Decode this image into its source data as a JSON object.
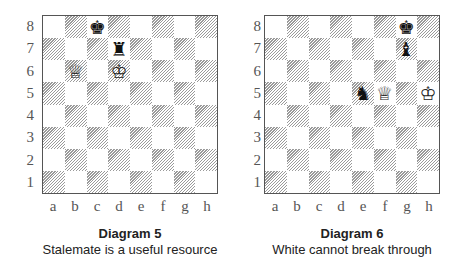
{
  "ranks": [
    "8",
    "7",
    "6",
    "5",
    "4",
    "3",
    "2",
    "1"
  ],
  "files": [
    "a",
    "b",
    "c",
    "d",
    "e",
    "f",
    "g",
    "h"
  ],
  "diagrams": [
    {
      "title": "Diagram 5",
      "caption": "Stalemate is a useful resource",
      "pieces": [
        {
          "square": "c8",
          "color": "black",
          "type": "king",
          "glyph": "♚"
        },
        {
          "square": "d7",
          "color": "black",
          "type": "rook",
          "glyph": "♜"
        },
        {
          "square": "b6",
          "color": "white",
          "type": "queen",
          "glyph": "♕"
        },
        {
          "square": "d6",
          "color": "white",
          "type": "king",
          "glyph": "♔"
        }
      ]
    },
    {
      "title": "Diagram 6",
      "caption": "White cannot break through",
      "pieces": [
        {
          "square": "g8",
          "color": "black",
          "type": "king",
          "glyph": "♚"
        },
        {
          "square": "g7",
          "color": "black",
          "type": "bishop",
          "glyph": "♝"
        },
        {
          "square": "e5",
          "color": "black",
          "type": "knight",
          "glyph": "♞"
        },
        {
          "square": "f5",
          "color": "white",
          "type": "queen",
          "glyph": "♕"
        },
        {
          "square": "h5",
          "color": "white",
          "type": "king",
          "glyph": "♔"
        }
      ]
    }
  ],
  "colors": {
    "border": "#555555",
    "hatch": "#9a9a9a",
    "light_square": "#ffffff",
    "label_text": "#555555",
    "caption_text": "#222222"
  }
}
